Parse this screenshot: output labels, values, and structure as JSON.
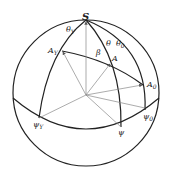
{
  "diagram": {
    "type": "spherical-coordinate-diagram",
    "labels": {
      "pole": "S",
      "theta_y": "θ",
      "theta_y_sub": "Y",
      "theta": "θ",
      "theta_0": "θ",
      "theta_0_sub": "0",
      "beta": "β",
      "A_y": "A",
      "A_y_sub": "Y",
      "A": "A",
      "A_0": "A",
      "A_0_sub": "0",
      "psi_y": "ψ",
      "psi_y_sub": "Y",
      "psi": "ψ",
      "psi_0": "ψ",
      "psi_0_sub": "0"
    },
    "colors": {
      "outline": "#222222",
      "vector": "#888888",
      "text": "#222222"
    }
  }
}
